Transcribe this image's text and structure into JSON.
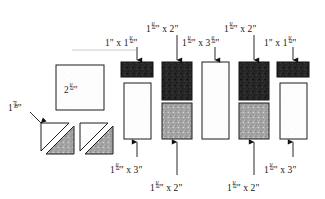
{
  "diagram": {
    "unit_symbol": "\"",
    "colors": {
      "page_background": "#ffffff",
      "outline": "#1a1a1a",
      "dark_fabric": "#2b2b2b",
      "medium_fabric": "#9a9a9a",
      "light_fabric": "#fdfdfd",
      "label_text": "#131313",
      "leader_line": "#b9b9b9"
    },
    "pieces": [
      {
        "id": "center-square",
        "name": "center-square",
        "shape": "square",
        "fabric": "light",
        "label": "2½\"",
        "label_position": "inside",
        "x": 56,
        "y": 65,
        "width": 48,
        "height": 45
      },
      {
        "id": "triangle-unit-left",
        "name": "half-square-triangle-left",
        "shape": "half-square-triangle",
        "fabric": "light-and-medium",
        "label": "1⅞\"",
        "label_position": "left",
        "x": 40,
        "y": 122,
        "width": 32,
        "height": 31
      },
      {
        "id": "triangle-unit-right",
        "name": "half-square-triangle-right",
        "shape": "half-square-triangle",
        "fabric": "light-and-medium",
        "label": "",
        "label_position": "none",
        "x": 79,
        "y": 122,
        "width": 32,
        "height": 31
      },
      {
        "id": "col1-top",
        "name": "dark-strip-col1",
        "shape": "rectangle",
        "fabric": "dark",
        "label": "1\" x 1½\"",
        "label_position": "top",
        "x": 121,
        "y": 62,
        "width": 32,
        "height": 15
      },
      {
        "id": "col1-bottom",
        "name": "light-strip-col1",
        "shape": "rectangle",
        "fabric": "light",
        "label": "1½\" x 3\"",
        "label_position": "bottom",
        "x": 124,
        "y": 83,
        "width": 27,
        "height": 56
      },
      {
        "id": "col2-top",
        "name": "dark-rect-col2",
        "shape": "rectangle",
        "fabric": "dark",
        "label": "1½\" x 2\"",
        "label_position": "top",
        "x": 162,
        "y": 62,
        "width": 30,
        "height": 38
      },
      {
        "id": "col2-bottom",
        "name": "medium-rect-col2",
        "shape": "rectangle",
        "fabric": "medium",
        "label": "1½\" x 2\"",
        "label_position": "bottom",
        "x": 162,
        "y": 103,
        "width": 30,
        "height": 36
      },
      {
        "id": "col3",
        "name": "light-rect-col3",
        "shape": "rectangle",
        "fabric": "light",
        "label": "1½\" x 3½\"",
        "label_position": "top",
        "x": 202,
        "y": 62,
        "width": 27,
        "height": 77
      },
      {
        "id": "col4-top",
        "name": "dark-rect-col4",
        "shape": "rectangle",
        "fabric": "dark",
        "label": "1½\" x 2\"",
        "label_position": "top",
        "x": 239,
        "y": 62,
        "width": 30,
        "height": 38
      },
      {
        "id": "col4-bottom",
        "name": "medium-rect-col4",
        "shape": "rectangle",
        "fabric": "medium",
        "label": "1½\" x 2\"",
        "label_position": "bottom",
        "x": 239,
        "y": 103,
        "width": 30,
        "height": 36
      },
      {
        "id": "col5-top",
        "name": "dark-strip-col5",
        "shape": "rectangle",
        "fabric": "dark",
        "label": "1\" x 1½\"",
        "label_position": "top",
        "x": 277,
        "y": 62,
        "width": 32,
        "height": 15
      },
      {
        "id": "col5-bottom",
        "name": "light-strip-col5",
        "shape": "rectangle",
        "fabric": "light",
        "label": "1½\" x 3\"",
        "label_position": "bottom",
        "x": 280,
        "y": 83,
        "width": 27,
        "height": 56
      }
    ],
    "labels": {
      "triangle_size": {
        "whole": "1",
        "num": "7",
        "den": "8",
        "unit": "\""
      },
      "square_size": {
        "whole": "2",
        "num": "1",
        "den": "2",
        "unit": "\""
      },
      "col1_top": {
        "a": "1",
        "unit_a": "\"",
        "sep": "x",
        "b_whole": "1",
        "b_num": "1",
        "b_den": "2",
        "unit_b": "\""
      },
      "col2_top": {
        "a_whole": "1",
        "a_num": "1",
        "a_den": "2",
        "unit_a": "\"",
        "sep": "x",
        "b": "2",
        "unit_b": "\""
      },
      "col3_top": {
        "a_whole": "1",
        "a_num": "1",
        "a_den": "2",
        "unit_a": "\"",
        "sep": "x",
        "b_whole": "3",
        "b_num": "1",
        "b_den": "2",
        "unit_b": "\""
      },
      "col4_top": {
        "a_whole": "1",
        "a_num": "1",
        "a_den": "2",
        "unit_a": "\"",
        "sep": "x",
        "b": "2",
        "unit_b": "\""
      },
      "col5_top": {
        "a": "1",
        "unit_a": "\"",
        "sep": "x",
        "b_whole": "1",
        "b_num": "1",
        "b_den": "2",
        "unit_b": "\""
      },
      "col1_bottom": {
        "a_whole": "1",
        "a_num": "1",
        "a_den": "2",
        "unit_a": "\"",
        "sep": "x",
        "b": "3",
        "unit_b": "\""
      },
      "col2_bottom": {
        "a_whole": "1",
        "a_num": "1",
        "a_den": "2",
        "unit_a": "\"",
        "sep": "x",
        "b": "2",
        "unit_b": "\""
      },
      "col4_bottom": {
        "a_whole": "1",
        "a_num": "1",
        "a_den": "2",
        "unit_a": "\"",
        "sep": "x",
        "b": "2",
        "unit_b": "\""
      },
      "col5_bottom": {
        "a_whole": "1",
        "a_num": "1",
        "a_den": "2",
        "unit_a": "\"",
        "sep": "x",
        "b": "3",
        "unit_b": "\""
      }
    }
  }
}
